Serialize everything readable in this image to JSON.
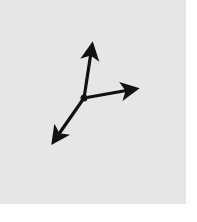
{
  "diagram": {
    "type": "coordinate-axes",
    "background_color": "#e6e6e6",
    "stroke_color": "#111111",
    "origin": {
      "x": 84,
      "y": 98
    },
    "axes": [
      {
        "name": "up-axis",
        "tip": {
          "x": 92,
          "y": 46
        }
      },
      {
        "name": "right-axis",
        "tip": {
          "x": 135,
          "y": 89
        }
      },
      {
        "name": "down-left-axis",
        "tip": {
          "x": 54,
          "y": 141
        }
      }
    ]
  }
}
